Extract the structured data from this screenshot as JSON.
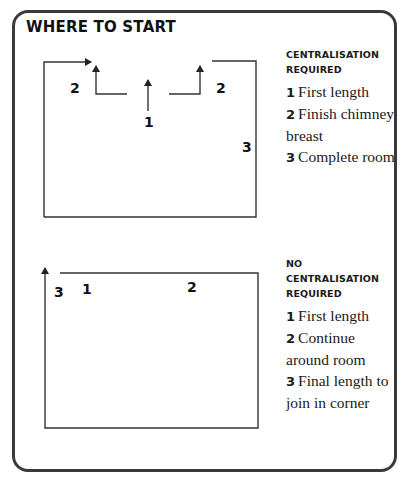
{
  "title": "WHERE TO START",
  "stroke_color": "#333333",
  "diagrams": [
    {
      "id": "centralisation",
      "labels": {
        "left_step": "2",
        "center": "1",
        "right_step": "2",
        "right_wall": "3"
      },
      "legend": {
        "heading_line1": "CENTRALISATION",
        "heading_line2": "REQUIRED",
        "items": [
          {
            "num": "1",
            "text": "First length"
          },
          {
            "num": "2",
            "text": "Finish chimney breast"
          },
          {
            "num": "3",
            "text": "Complete room"
          }
        ]
      }
    },
    {
      "id": "no-centralisation",
      "labels": {
        "corner": "3",
        "start": "1",
        "top": "2"
      },
      "legend": {
        "heading_line1": "NO",
        "heading_line2": "CENTRALISATION",
        "heading_line3": "REQUIRED",
        "items": [
          {
            "num": "1",
            "text": "First length"
          },
          {
            "num": "2",
            "text": "Continue around room"
          },
          {
            "num": "3",
            "text": "Final length to join in corner"
          }
        ]
      }
    }
  ]
}
